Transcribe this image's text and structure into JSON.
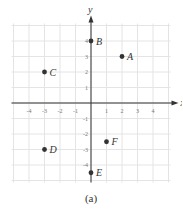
{
  "chart_data": {
    "type": "scatter",
    "title": "",
    "caption": "(a)",
    "xlabel": "x",
    "ylabel": "y",
    "xlim": [
      -5,
      5
    ],
    "ylim": [
      -5,
      5
    ],
    "grid": true,
    "x_ticks": [
      -4,
      -3,
      -2,
      -1,
      1,
      2,
      3,
      4
    ],
    "y_ticks": [
      -4,
      -3,
      -2,
      -1,
      1,
      2,
      3,
      4
    ],
    "points": [
      {
        "label": "A",
        "x": 2,
        "y": 3
      },
      {
        "label": "B",
        "x": 0,
        "y": 4
      },
      {
        "label": "C",
        "x": -3,
        "y": 2
      },
      {
        "label": "D",
        "x": -3,
        "y": -3
      },
      {
        "label": "E",
        "x": 0,
        "y": -4.5
      },
      {
        "label": "F",
        "x": 1,
        "y": -2.5
      }
    ],
    "colors": {
      "grid": "#e4e4e4",
      "axis": "#333333",
      "point": "#333333",
      "tick_label": "#777777"
    }
  }
}
